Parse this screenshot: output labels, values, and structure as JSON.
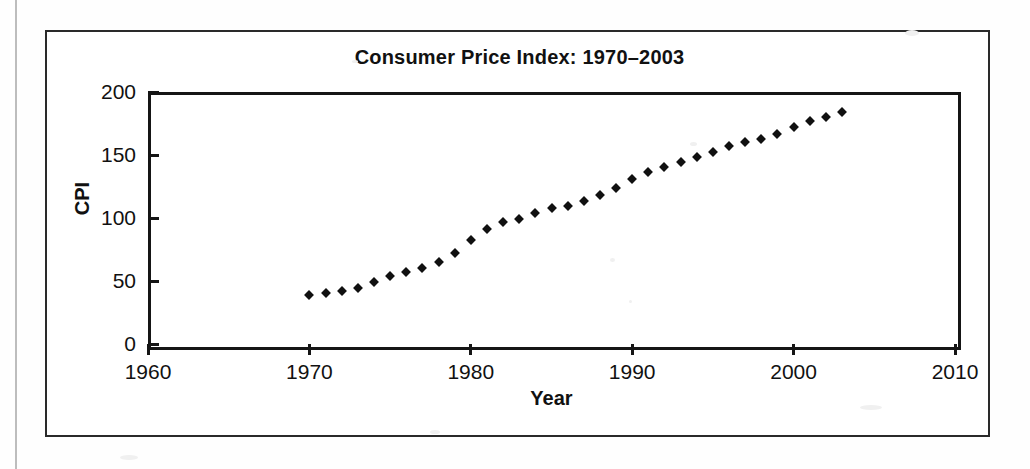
{
  "figure": {
    "title": "Consumer Price Index: 1970–2003",
    "border_color": "#2a2a2a",
    "background": "#ffffff"
  },
  "chart_data": {
    "type": "scatter",
    "title": "Consumer Price Index: 1970–2003",
    "xlabel": "Year",
    "ylabel": "CPI",
    "xlim": [
      1960,
      2010
    ],
    "ylim": [
      0,
      200
    ],
    "xticks": [
      1960,
      1970,
      1980,
      1990,
      2000,
      2010
    ],
    "yticks": [
      0,
      50,
      100,
      150,
      200
    ],
    "grid": false,
    "legend": null,
    "marker": "diamond",
    "marker_color": "#101010",
    "x": [
      1970,
      1971,
      1972,
      1973,
      1974,
      1975,
      1976,
      1977,
      1978,
      1979,
      1980,
      1981,
      1982,
      1983,
      1984,
      1985,
      1986,
      1987,
      1988,
      1989,
      1990,
      1991,
      1992,
      1993,
      1994,
      1995,
      1996,
      1997,
      1998,
      1999,
      2000,
      2001,
      2002,
      2003
    ],
    "values": [
      38.8,
      40.5,
      41.8,
      44.4,
      49.3,
      53.8,
      56.9,
      60.6,
      65.2,
      72.6,
      82.4,
      90.9,
      96.5,
      99.6,
      103.9,
      107.6,
      109.6,
      113.6,
      118.3,
      124.0,
      130.7,
      136.2,
      140.3,
      144.5,
      148.2,
      152.4,
      156.9,
      160.5,
      163.0,
      166.6,
      172.2,
      177.1,
      179.9,
      184.0
    ]
  },
  "icons": {
    "marker": "diamond-marker"
  }
}
